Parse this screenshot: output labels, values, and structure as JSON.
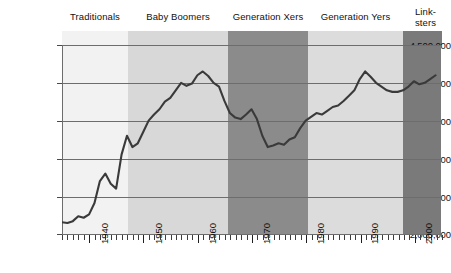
{
  "chart_data": {
    "type": "line",
    "title": "",
    "subtitle": "",
    "xlabel": "",
    "ylabel": "",
    "xlim": [
      1935,
      2005
    ],
    "ylim": [
      2000000,
      4500000
    ],
    "grid": true,
    "legend_position": "none",
    "y_ticks": [
      "4,500,000",
      "4,000,000",
      "3,500,000",
      "3,000,000",
      "2,500,000",
      "2,000,000"
    ],
    "y_tick_values": [
      4500000,
      4000000,
      3500000,
      3000000,
      2500000,
      2000000
    ],
    "x_ticks": [
      "1940",
      "1950",
      "1960",
      "1970",
      "1980",
      "1990",
      "2000"
    ],
    "x_tick_values": [
      1940,
      1950,
      1960,
      1970,
      1980,
      1990,
      2000
    ],
    "series": [
      {
        "name": "US births",
        "color": "#3a3a3a",
        "x": [
          1935,
          1936,
          1937,
          1938,
          1939,
          1940,
          1941,
          1942,
          1943,
          1944,
          1945,
          1946,
          1947,
          1948,
          1949,
          1950,
          1951,
          1952,
          1953,
          1954,
          1955,
          1956,
          1957,
          1958,
          1959,
          1960,
          1961,
          1962,
          1963,
          1964,
          1965,
          1966,
          1967,
          1968,
          1969,
          1970,
          1971,
          1972,
          1973,
          1974,
          1975,
          1976,
          1977,
          1978,
          1979,
          1980,
          1981,
          1982,
          1983,
          1984,
          1985,
          1986,
          1987,
          1988,
          1989,
          1990,
          1991,
          1992,
          1993,
          1994,
          1995,
          1996,
          1997,
          1998,
          1999,
          2000,
          2001,
          2002,
          2003,
          2004
        ],
        "values": [
          2155000,
          2145000,
          2170000,
          2235000,
          2215000,
          2260000,
          2410000,
          2700000,
          2800000,
          2665000,
          2600000,
          3050000,
          3300000,
          3150000,
          3200000,
          3350000,
          3500000,
          3580000,
          3650000,
          3750000,
          3800000,
          3900000,
          4000000,
          3960000,
          3990000,
          4100000,
          4150000,
          4090000,
          4000000,
          3950000,
          3760000,
          3600000,
          3540000,
          3520000,
          3580000,
          3650000,
          3520000,
          3300000,
          3150000,
          3170000,
          3200000,
          3180000,
          3250000,
          3280000,
          3400000,
          3500000,
          3550000,
          3600000,
          3580000,
          3630000,
          3680000,
          3700000,
          3760000,
          3830000,
          3900000,
          4050000,
          4150000,
          4080000,
          4000000,
          3950000,
          3900000,
          3880000,
          3880000,
          3900000,
          3950000,
          4020000,
          3980000,
          4000000,
          4050000,
          4100000
        ]
      }
    ],
    "bands": [
      {
        "label": "Traditionals",
        "x_start": 1935,
        "x_end": 1947,
        "color": "#f2f2f2"
      },
      {
        "label": "Baby Boomers",
        "x_start": 1947,
        "x_end": 1965,
        "color": "#d8d8d8"
      },
      {
        "label": "Generation Xers",
        "x_start": 1965,
        "x_end": 1980,
        "color": "#8b8b8b"
      },
      {
        "label": "Generation Yers",
        "x_start": 1980,
        "x_end": 1997,
        "color": "#dcdcdc"
      },
      {
        "label": "Link-\nsters",
        "x_start": 1997,
        "x_end": 2005,
        "color": "#7a7a7a"
      }
    ]
  },
  "colors": {
    "line": "#3a3a3a",
    "gridline": "#6d6d6d",
    "axis": "#1f1f1f",
    "text": "#111111",
    "background": "#ffffff"
  }
}
